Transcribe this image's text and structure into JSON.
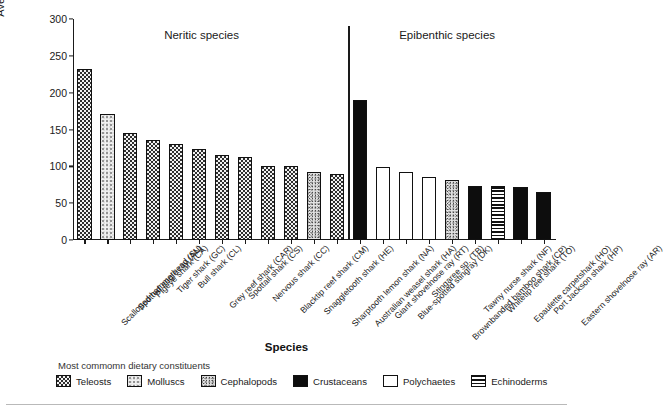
{
  "chart_data": {
    "type": "bar",
    "title": "",
    "xlabel": "Species",
    "ylabel": "Average number of olfactory lamellae",
    "ylim": [
      0,
      300
    ],
    "yticks": [
      0,
      50,
      100,
      150,
      200,
      250,
      300
    ],
    "grid": false,
    "legend_position": "bottom",
    "group_labels": [
      "Neritic species",
      "Epibenthic species"
    ],
    "group_split_after_index": 11,
    "categories": [
      "Scalloped hammerhead (SL)",
      "Spotted eagle ray (AN)",
      "Pigeye shark (CA)",
      "Tiger shark (GC)",
      "Bull shark (CL)",
      "Grey reef shark (CAR)",
      "Spottail shark (CS)",
      "Nervous shark (CC)",
      "Blacktip reef shark (CM)",
      "Snaggletooth shark (HE)",
      "Sharptooth lemon shark (NA)",
      "Australian weasel shark (HA)",
      "Giant shovelnose ray (RT)",
      "Blue-spotted stingray (DK)",
      "Stingaree sp. (TB)",
      "Brownbanded bamboo shark (CP)",
      "Tawny nurse shark (NF)",
      "Whitetip reef shark (TO)",
      "Epaulette carpetshark (HO)",
      "Port Jackson shark (HP)",
      "Eastern shovelnose ray (AR)"
    ],
    "values": [
      232,
      171,
      145,
      136,
      130,
      124,
      115,
      113,
      100,
      100,
      93,
      89,
      190,
      99,
      92,
      85,
      82,
      74,
      73,
      72,
      65
    ],
    "diet_categories": [
      "Teleosts",
      "Molluscs",
      "Teleosts",
      "Teleosts",
      "Teleosts",
      "Teleosts",
      "Teleosts",
      "Teleosts",
      "Teleosts",
      "Teleosts",
      "Cephalopods",
      "Teleosts",
      "Crustaceans",
      "Polychaetes",
      "Polychaetes",
      "Polychaetes",
      "Cephalopods",
      "Crustaceans",
      "Echinoderms",
      "Crustaceans",
      "Crustaceans"
    ]
  },
  "legend": {
    "title": "Most commomn dietary constituents",
    "items": [
      {
        "label": "Teleosts",
        "pattern": "teleosts"
      },
      {
        "label": "Molluscs",
        "pattern": "molluscs"
      },
      {
        "label": "Cephalopods",
        "pattern": "cephalopods"
      },
      {
        "label": "Crustaceans",
        "pattern": "crustaceans"
      },
      {
        "label": "Polychaetes",
        "pattern": "polychaetes"
      },
      {
        "label": "Echinoderms",
        "pattern": "echinoderms"
      }
    ]
  }
}
